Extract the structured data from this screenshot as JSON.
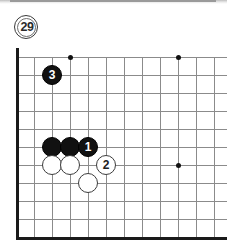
{
  "figure": {
    "number": "29",
    "badge_name": "figure-number-badge"
  },
  "board": {
    "type": "go-board-diagram",
    "grid_spacing_px": 18,
    "origin_x_px": 16,
    "origin_y_px": 57,
    "columns": 12,
    "rows": 10,
    "line_color": "#8b8b8b",
    "edge_color": "#1a1a1a",
    "background_color": "#ffffff",
    "star_points": [
      {
        "col": 3,
        "row": 0
      },
      {
        "col": 9,
        "row": 0
      },
      {
        "col": 9,
        "row": 6
      }
    ],
    "stones": [
      {
        "color": "black",
        "label": "",
        "col": 2,
        "row": 5,
        "name": "black-stone-c5"
      },
      {
        "color": "black",
        "label": "",
        "col": 3,
        "row": 5,
        "name": "black-stone-d5"
      },
      {
        "color": "black",
        "label": "1",
        "col": 4,
        "row": 5,
        "name": "black-stone-move-1"
      },
      {
        "color": "black",
        "label": "3",
        "col": 2,
        "row": 1,
        "name": "black-stone-move-3"
      },
      {
        "color": "white",
        "label": "",
        "col": 2,
        "row": 6,
        "name": "white-stone-c6"
      },
      {
        "color": "white",
        "label": "",
        "col": 3,
        "row": 6,
        "name": "white-stone-d6"
      },
      {
        "color": "white",
        "label": "2",
        "col": 5,
        "row": 6,
        "name": "white-stone-move-2"
      },
      {
        "color": "white",
        "label": "",
        "col": 4,
        "row": 7,
        "name": "white-stone-e7"
      }
    ]
  }
}
